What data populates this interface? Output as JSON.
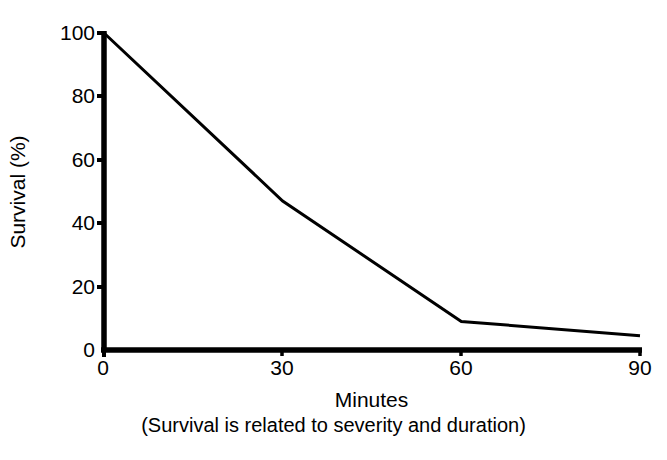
{
  "chart_data": {
    "type": "line",
    "title": "",
    "xlabel": "Minutes",
    "ylabel": "Survival (%)",
    "caption": "(Survival is related to severity and duration)",
    "x": [
      0,
      30,
      60,
      90
    ],
    "values": [
      100,
      47,
      9,
      4.5
    ],
    "series": [
      {
        "name": "Survival",
        "values": [
          100,
          47,
          9,
          4.5
        ]
      }
    ],
    "xlim": [
      0,
      90
    ],
    "ylim": [
      0,
      100
    ],
    "xticks": [
      "0",
      "30",
      "60",
      "90"
    ],
    "yticks": [
      "0",
      "20",
      "40",
      "60",
      "80",
      "100"
    ],
    "xtick_values": [
      0,
      30,
      60,
      90
    ],
    "ytick_values": [
      0,
      20,
      40,
      60,
      80,
      100
    ],
    "grid": false,
    "legend": false,
    "legend_position": "none",
    "line_color": "#000000",
    "axis_color": "#000000",
    "background_color": "#ffffff"
  },
  "figure": {
    "ylabel": "Survival (%)",
    "xlabel": "Minutes",
    "caption": "(Survival is related to severity and duration)"
  }
}
